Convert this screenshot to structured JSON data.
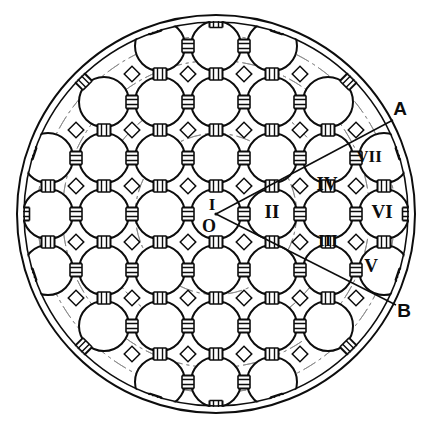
{
  "figure": {
    "kind": "engineering-cross-section-diagram",
    "background_color": "#ffffff",
    "ink_color": "#0d0d0d",
    "faint_ink_color": "#8a8a8a"
  },
  "outer_boundary": {
    "name": "outer-shell",
    "center": {
      "x": 216,
      "y": 214
    },
    "outer_radius": 199,
    "inner_radius": 192,
    "stroke_width": 2.0
  },
  "geometry": {
    "grid_pitch": 56,
    "circle_radius": 25,
    "connector_length": 12,
    "connector_width": 13,
    "connector_bar_gap": 5,
    "interstitial_size": 11
  },
  "center_marker": {
    "name": "origin-point",
    "label_upper": "I",
    "label_lower": "O",
    "x": 216,
    "y": 214,
    "label_upper_x": 212,
    "label_upper_y": 206,
    "label_lower_x": 209,
    "label_lower_y": 228
  },
  "callouts": [
    {
      "id": "callout-a",
      "label": "A",
      "label_x": 400,
      "label_y": 110,
      "leader": {
        "x1": 216,
        "y1": 214,
        "x2": 393,
        "y2": 120
      },
      "angle_deg": -28
    },
    {
      "id": "callout-b",
      "label": "B",
      "label_x": 404,
      "label_y": 312,
      "leader": {
        "x1": 216,
        "y1": 214,
        "x2": 396,
        "y2": 305
      },
      "angle_deg": 27
    }
  ],
  "labeled_elements": [
    {
      "id": "element-1",
      "label": "I",
      "x": 216,
      "y": 214,
      "note": "central element at origin"
    },
    {
      "id": "element-2",
      "label": "II",
      "x": 272,
      "y": 214,
      "note": "first ring, due right"
    },
    {
      "id": "element-3",
      "label": "III",
      "x": 328,
      "y": 242,
      "note": "lower right of second ring"
    },
    {
      "id": "element-4",
      "label": "IV",
      "x": 327,
      "y": 186,
      "note": "upper right of second ring"
    },
    {
      "id": "element-5",
      "label": "V",
      "x": 371,
      "y": 268,
      "note": "outer ring, lower right"
    },
    {
      "id": "element-6",
      "label": "VI",
      "x": 382,
      "y": 214,
      "note": "outer ring, due right"
    },
    {
      "id": "element-7",
      "label": "VII",
      "x": 369,
      "y": 158,
      "note": "outer ring, upper right"
    }
  ],
  "legend_note": {
    "circle_count_visible": 44,
    "symmetry": "square lattice packing inside circular shell"
  }
}
